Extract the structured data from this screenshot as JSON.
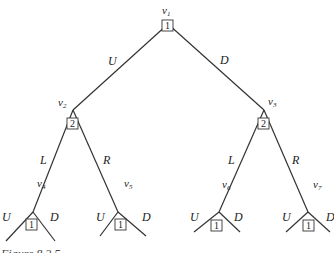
{
  "diagram": {
    "type": "game-tree",
    "caption": "Figure 8.2.5",
    "nodes": [
      {
        "id": "v1",
        "name": "v",
        "sub": "1",
        "player": "1"
      },
      {
        "id": "v2",
        "name": "v",
        "sub": "2",
        "player": "2"
      },
      {
        "id": "v3",
        "name": "v",
        "sub": "3",
        "player": "2"
      },
      {
        "id": "v4",
        "name": "v",
        "sub": "4",
        "player": "1"
      },
      {
        "id": "v5",
        "name": "v",
        "sub": "5",
        "player": "1"
      },
      {
        "id": "v6",
        "name": "v",
        "sub": "6",
        "player": "1"
      },
      {
        "id": "v7",
        "name": "v",
        "sub": "7",
        "player": "1"
      }
    ],
    "edges": [
      {
        "from": "v1",
        "to": "v2",
        "label": "U"
      },
      {
        "from": "v1",
        "to": "v3",
        "label": "D"
      },
      {
        "from": "v2",
        "to": "v4",
        "label": "L"
      },
      {
        "from": "v2",
        "to": "v5",
        "label": "R"
      },
      {
        "from": "v3",
        "to": "v6",
        "label": "L"
      },
      {
        "from": "v3",
        "to": "v7",
        "label": "R"
      },
      {
        "from": "v4",
        "to": "leaf1",
        "label": "U"
      },
      {
        "from": "v4",
        "to": "leaf2",
        "label": "D"
      },
      {
        "from": "v5",
        "to": "leaf3",
        "label": "U"
      },
      {
        "from": "v5",
        "to": "leaf4",
        "label": "D"
      },
      {
        "from": "v6",
        "to": "leaf5",
        "label": "U"
      },
      {
        "from": "v6",
        "to": "leaf6",
        "label": "D"
      },
      {
        "from": "v7",
        "to": "leaf7",
        "label": "U"
      },
      {
        "from": "v7",
        "to": "leaf8",
        "label": "D"
      }
    ]
  }
}
